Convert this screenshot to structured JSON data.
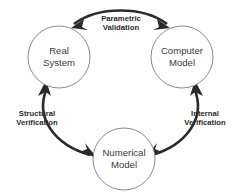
{
  "diagram": {
    "background_color": "#ffffff",
    "node_stroke_color": "#8a8a8a",
    "arrow_color": "#2b2b2b",
    "node_text_color": "#3a3a3a",
    "nodes": [
      {
        "id": "real-system",
        "line1": "Real",
        "line2": "System",
        "cx": 59,
        "cy": 57,
        "r": 31
      },
      {
        "id": "computer-model",
        "line1": "Computer",
        "line2": "Model",
        "cx": 182,
        "cy": 57,
        "r": 31
      },
      {
        "id": "numerical-model",
        "line1": "Numerical",
        "line2": "Model",
        "cx": 124,
        "cy": 159,
        "r": 31
      }
    ],
    "edges": [
      {
        "id": "parametric-validation",
        "line1": "Parametric",
        "line2": "Validation",
        "from": "real-system",
        "to": "computer-model",
        "direction": "bidirectional"
      },
      {
        "id": "structural-verification",
        "line1": "Structural",
        "line2": "Verification",
        "from": "numerical-model",
        "to": "real-system",
        "direction": "bidirectional"
      },
      {
        "id": "internal-verification",
        "line1": "Internal",
        "line2": "Verification",
        "from": "computer-model",
        "to": "numerical-model",
        "direction": "bidirectional"
      }
    ]
  }
}
